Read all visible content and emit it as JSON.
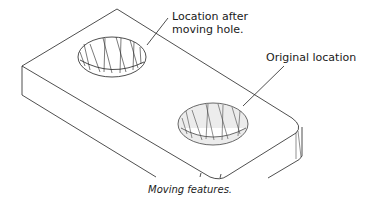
{
  "diagram": {
    "labels": {
      "moved": [
        "Location after",
        "moving hole."
      ],
      "original": "Original location"
    },
    "caption": "Moving features.",
    "colors": {
      "line": "#222222",
      "hole_shade": "#ececec",
      "background": "#ffffff"
    }
  }
}
